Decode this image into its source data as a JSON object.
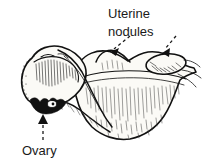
{
  "figure": {
    "background_color": "#ffffff",
    "ink_color": "#111111",
    "style": "pen-and-ink medical line art with hatching",
    "width": 206,
    "height": 163
  },
  "labels": {
    "uterine_nodules": {
      "line1": "Uterine",
      "line2": "nodules",
      "x": 108,
      "y": 18,
      "line_height": 18
    },
    "ovary": {
      "text": "Ovary",
      "x": 22,
      "y": 155
    }
  },
  "annotations": {
    "arrow_left_nodule": {
      "name": "leader-arrow-left-nodule",
      "from_x": 128,
      "from_y": 38,
      "to_x": 110,
      "to_y": 52,
      "style": "dashed-with-solid-head"
    },
    "arrow_right_nodule": {
      "name": "leader-arrow-right-nodule",
      "from_x": 172,
      "from_y": 38,
      "to_x": 162,
      "to_y": 52,
      "style": "dashed-with-solid-head"
    },
    "arrow_ovary": {
      "name": "leader-arrow-ovary",
      "from_x": 43,
      "from_y": 140,
      "to_x": 43,
      "to_y": 116,
      "style": "dashed-with-solid-head"
    }
  },
  "structures": {
    "ovary": {
      "name": "ovary",
      "description": "rounded ovoid organ at left with stippled margin and dense internal hatching",
      "center_x": 45,
      "center_y": 80
    },
    "uterus_body": {
      "name": "uterus-body",
      "description": "large hatched uterine corpus occupying center and right of the frame",
      "center_x": 125,
      "center_y": 95
    },
    "nodule_left": {
      "name": "uterine-nodule-left",
      "description": "rounded bulge on the superior uterine contour",
      "center_x": 112,
      "center_y": 56
    },
    "nodule_right": {
      "name": "uterine-nodule-right",
      "description": "oval subserosal nodule near the right cornu with radiating hatching",
      "center_x": 166,
      "center_y": 62
    },
    "fallopian_tube": {
      "name": "fallopian-tube",
      "description": "tube sweeping from the uterine cornu toward the ovary"
    },
    "fimbriae": {
      "name": "fimbriae",
      "description": "dark finger-like projections beneath the ovary"
    },
    "broad_ligament": {
      "name": "broad-ligament",
      "description": "sheet of tissue below the tube rendered with light hatching"
    }
  }
}
